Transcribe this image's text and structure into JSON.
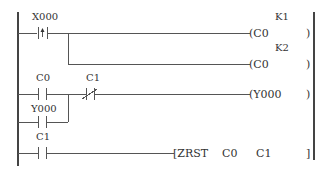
{
  "diagram": {
    "type": "ladder-logic",
    "rungs": [
      {
        "contacts": [
          {
            "label": "X000",
            "type": "rising-edge"
          }
        ],
        "outputs": [
          {
            "coil": "C0",
            "constant": "K1"
          },
          {
            "coil": "C0",
            "constant": "K2"
          }
        ]
      },
      {
        "contacts": [
          {
            "label": "C0",
            "type": "normally-open"
          },
          {
            "label": "C1",
            "type": "normally-closed"
          }
        ],
        "parallel": [
          {
            "label": "Y000",
            "type": "normally-open"
          }
        ],
        "outputs": [
          {
            "coil": "Y000"
          }
        ]
      },
      {
        "contacts": [
          {
            "label": "C1",
            "type": "normally-open"
          }
        ],
        "instruction": {
          "op": "ZRST",
          "arg1": "C0",
          "arg2": "C1"
        }
      }
    ]
  },
  "labels": {
    "x000": "X000",
    "k1": "K1",
    "k2": "K2",
    "c0_coil_1": "(C0",
    "c0_coil_2": "(C0",
    "c0_contact": "C0",
    "c1_nc": "C1",
    "y000_coil": "(Y000",
    "y000_contact": "Y000",
    "c1_contact": "C1",
    "zrst": "[ZRST",
    "zrst_arg1": "C0",
    "zrst_arg2": "C1",
    "close_paren": ")",
    "close_bracket": "]"
  }
}
